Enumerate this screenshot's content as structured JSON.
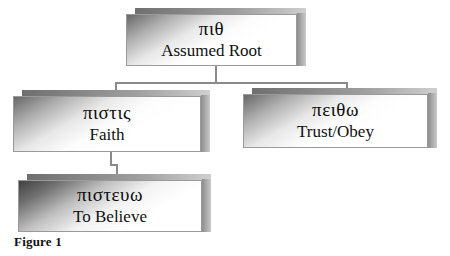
{
  "figure": {
    "caption": "Figure 1",
    "type": "hierarchy-tree"
  },
  "nodes": {
    "root": {
      "greek": "πιθ",
      "gloss": "Assumed Root"
    },
    "pistis": {
      "greek": "πιστις",
      "gloss": "Faith"
    },
    "peitho": {
      "greek": "πειθω",
      "gloss": "Trust/Obey"
    },
    "pisteuo": {
      "greek": "πιστευω",
      "gloss": "To Believe"
    }
  },
  "edges": [
    {
      "from": "root",
      "to": "pistis"
    },
    {
      "from": "root",
      "to": "peitho"
    },
    {
      "from": "pistis",
      "to": "pisteuo"
    }
  ],
  "colors": {
    "line": "#8a8a8a",
    "box_border": "#9a9a9a",
    "text": "#0d0d0d",
    "background": "#ffffff"
  }
}
